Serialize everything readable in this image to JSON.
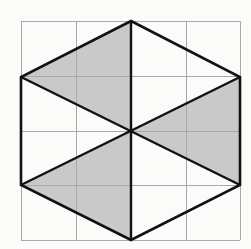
{
  "figure": {
    "caption": "",
    "background_color": "#fbfbfa",
    "canvas": {
      "width": 251,
      "height": 249
    }
  },
  "grid": {
    "label": "square grid",
    "columns": 4,
    "rows": 4,
    "line_color": "#a9a9a9",
    "line_width": 1,
    "x_lines": [
      21,
      76,
      131,
      186,
      240
    ],
    "y_lines": [
      21,
      76,
      131,
      185,
      240
    ],
    "bounds": {
      "left": 21,
      "top": 21,
      "right": 240,
      "bottom": 240
    }
  },
  "hexagon": {
    "label": "hexagon outline",
    "stroke_color": "#111111",
    "stroke_width": 2.6,
    "fill": "none",
    "vertices": [
      {
        "name": "top",
        "x": 131,
        "y": 21
      },
      {
        "name": "upper-right",
        "x": 240,
        "y": 77
      },
      {
        "name": "lower-right",
        "x": 240,
        "y": 185
      },
      {
        "name": "bottom",
        "x": 131,
        "y": 240
      },
      {
        "name": "lower-left",
        "x": 21,
        "y": 185
      },
      {
        "name": "upper-left",
        "x": 21,
        "y": 77
      }
    ],
    "center": {
      "x": 131,
      "y": 131
    }
  },
  "shaded_regions": [
    {
      "name": "upper-left-shaded-triangle",
      "fill_color": "#c9c9c9",
      "points": [
        {
          "x": 21,
          "y": 77
        },
        {
          "x": 131,
          "y": 21
        },
        {
          "x": 131,
          "y": 131
        }
      ]
    },
    {
      "name": "lower-left-shaded-triangle",
      "fill_color": "#c9c9c9",
      "points": [
        {
          "x": 21,
          "y": 185
        },
        {
          "x": 131,
          "y": 240
        },
        {
          "x": 131,
          "y": 131
        }
      ]
    },
    {
      "name": "right-shaded-triangle",
      "fill_color": "#c9c9c9",
      "points": [
        {
          "x": 240,
          "y": 77
        },
        {
          "x": 240,
          "y": 185
        },
        {
          "x": 131,
          "y": 131
        }
      ]
    }
  ],
  "internal_lines": [
    {
      "name": "vertical-axis-line",
      "stroke_color": "#111111",
      "stroke_width": 2.4,
      "x1": 131,
      "y1": 21,
      "x2": 131,
      "y2": 240
    },
    {
      "name": "diagonal-upper-left-to-lower-right",
      "stroke_color": "#111111",
      "stroke_width": 2.4,
      "x1": 21,
      "y1": 77,
      "x2": 240,
      "y2": 185
    },
    {
      "name": "diagonal-lower-left-to-upper-right",
      "stroke_color": "#111111",
      "stroke_width": 2.4,
      "x1": 21,
      "y1": 185,
      "x2": 240,
      "y2": 77
    }
  ]
}
